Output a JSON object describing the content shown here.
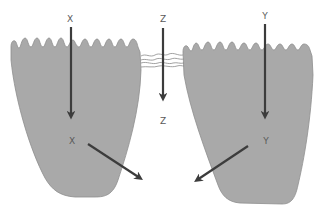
{
  "diagram": {
    "type": "epithelial-transport-pathways",
    "colors": {
      "cell_fill": "#a9a9a9",
      "cell_stroke": "#8e8e8e",
      "arrow": "#3c3c3c",
      "junction": "#8a8a8a",
      "label": "#5a5a5a",
      "background": "#ffffff"
    },
    "cells": [
      {
        "id": "left-cell",
        "pathway": "X"
      },
      {
        "id": "right-cell",
        "pathway": "Y"
      }
    ],
    "labels": {
      "x_top": "X",
      "x_mid": "X",
      "z_top": "Z",
      "z_bottom": "Z",
      "y_top": "Y",
      "y_mid": "Y"
    },
    "pathways": [
      {
        "name": "X",
        "route": "transcellular (left cell)",
        "exit": "basolateral, rightward"
      },
      {
        "name": "Z",
        "route": "paracellular (through tight junction)",
        "exit": "straight down"
      },
      {
        "name": "Y",
        "route": "transcellular (right cell)",
        "exit": "basolateral, leftward"
      }
    ]
  }
}
